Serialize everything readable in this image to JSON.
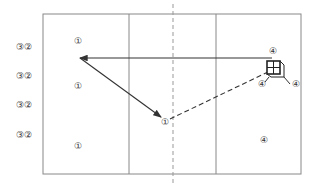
{
  "diagram": {
    "type": "court-drill",
    "colors": {
      "line": "#888888",
      "dark": "#333333",
      "background": "#ffffff"
    },
    "court": {
      "x": 43,
      "y": 14,
      "w": 258,
      "h": 160,
      "solid_dividers_x": [
        129,
        216
      ],
      "dashed_center_x": 173
    },
    "outside_labels": [
      {
        "text": "③②",
        "x": 24,
        "y": 47
      },
      {
        "text": "③②",
        "x": 24,
        "y": 76
      },
      {
        "text": "③②",
        "x": 24,
        "y": 105
      },
      {
        "text": "③②",
        "x": 24,
        "y": 135
      }
    ],
    "players_1": [
      {
        "text": "①",
        "x": 78,
        "y": 41
      },
      {
        "text": "①",
        "x": 78,
        "y": 86
      },
      {
        "text": "①",
        "x": 78,
        "y": 146
      },
      {
        "text": "①",
        "x": 165,
        "y": 122
      }
    ],
    "players_4": [
      {
        "text": "④",
        "x": 273,
        "y": 51
      },
      {
        "text": "④",
        "x": 262,
        "y": 84
      },
      {
        "text": "④",
        "x": 296,
        "y": 84
      },
      {
        "text": "④",
        "x": 264,
        "y": 140
      }
    ],
    "paths": [
      {
        "kind": "solid-arrow",
        "from": [
          272,
          58
        ],
        "to": [
          80,
          58
        ]
      },
      {
        "kind": "solid-arrow",
        "from": [
          80,
          58
        ],
        "to": [
          161,
          117
        ]
      },
      {
        "kind": "dashed",
        "from": [
          170,
          119
        ],
        "to": [
          268,
          72
        ]
      }
    ],
    "ball_cart": {
      "x": 267,
      "y": 61,
      "size": 13
    }
  }
}
